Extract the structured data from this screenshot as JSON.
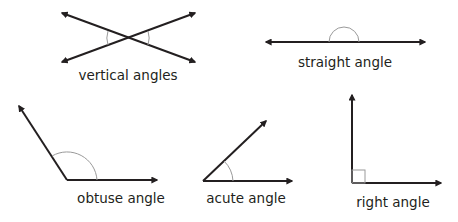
{
  "colors": {
    "line": "#231f20",
    "arc": "#9a9a9a",
    "background": "#ffffff"
  },
  "figures": [
    {
      "id": "vertical",
      "label": "vertical angles"
    },
    {
      "id": "straight",
      "label": "straight angle"
    },
    {
      "id": "obtuse",
      "label": "obtuse angle"
    },
    {
      "id": "acute",
      "label": "acute angle"
    },
    {
      "id": "right",
      "label": "right angle"
    }
  ]
}
